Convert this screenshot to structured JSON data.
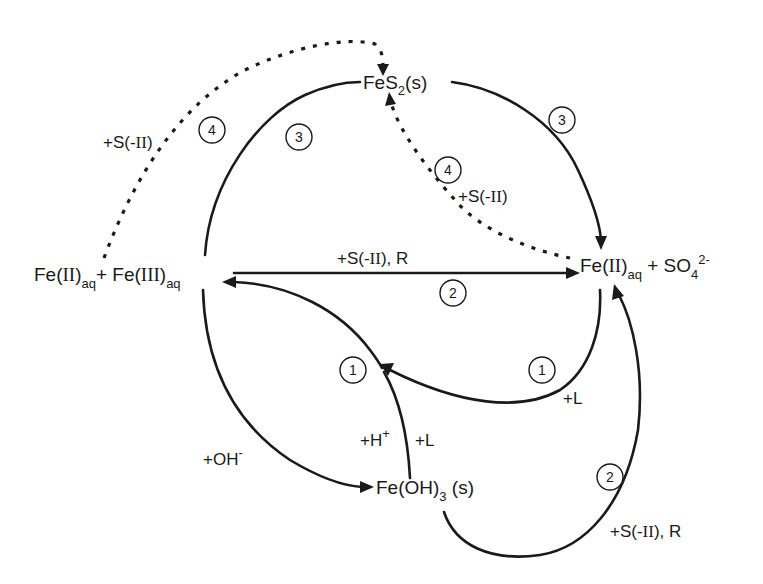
{
  "diagram": {
    "type": "reaction-cycle",
    "nodes": {
      "fes2": {
        "main": "FeS",
        "sub": "2",
        "tail": "(s)"
      },
      "fe_mixed": {
        "part1_main": "Fe(",
        "part1_roman": "II",
        "part1_close": ")",
        "part1_sub": "aq",
        "plus": "+ ",
        "part2_main": "Fe(",
        "part2_roman": "III",
        "part2_close": ")",
        "part2_sub": "aq"
      },
      "fe2_so4": {
        "main": "Fe(",
        "roman": "II",
        "close": ")",
        "sub": "aq",
        "plus": " + SO",
        "so4_sub": "4",
        "so4_sup": "2-"
      },
      "feoh3": {
        "main": "Fe(OH)",
        "sub": "3",
        "tail": " (s)"
      }
    },
    "reagents": {
      "s2_top_left": {
        "pre": "+S(-",
        "roman": "II",
        "post": ")"
      },
      "s2_mid": {
        "pre": "+S(-",
        "roman": "II",
        "post": ")"
      },
      "s2_r_top": {
        "pre": "+S(-",
        "roman": "II",
        "post": "), R"
      },
      "s2_r_bottom": {
        "pre": "+S(-",
        "roman": "II",
        "post": "), R"
      },
      "ligand_right": "+L",
      "oh": {
        "main": "+OH",
        "sup": "-"
      },
      "h_plus": {
        "main": "+H",
        "sup": "+"
      },
      "ligand_center": "+L"
    },
    "steps": [
      {
        "id": "step-4-left",
        "number": "4",
        "pathway": "dashed: Fe(II)aq → FeS2(s) via +S(-II)"
      },
      {
        "id": "step-3-left",
        "number": "3",
        "pathway": "solid: Fe(III)aq ↔ FeS2(s)"
      },
      {
        "id": "step-3-right",
        "number": "3",
        "pathway": "solid: FeS2(s) → Fe(II)aq + SO4 2-"
      },
      {
        "id": "step-4-mid",
        "number": "4",
        "pathway": "dashed: Fe(II)aq → FeS2(s) via +S(-II)"
      },
      {
        "id": "step-2-top",
        "number": "2",
        "pathway": "solid: Fe(III)aq → Fe(II)aq via +S(-II), R"
      },
      {
        "id": "step-1-left",
        "number": "1",
        "pathway": "solid: Fe(OH)3(s) → Fe(III)aq via +H+, +L"
      },
      {
        "id": "step-1-right",
        "number": "1",
        "pathway": "solid: Fe(II)aq → Fe(III)aq via +L"
      },
      {
        "id": "step-2-bottom",
        "number": "2",
        "pathway": "solid: Fe(OH)3(s) → Fe(II)aq via +S(-II), R"
      }
    ],
    "colors": {
      "ink": "#1a1a1a",
      "background": "#ffffff"
    }
  }
}
